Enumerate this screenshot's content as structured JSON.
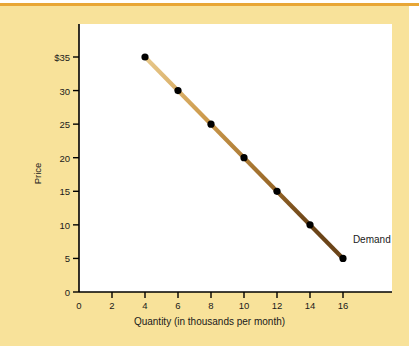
{
  "figure": {
    "background_color": "#F8E29A",
    "plot_background_color": "#FFFFFF",
    "rule_color": "#E8A636",
    "line_color": "#C08A3E",
    "point_color": "#000000"
  },
  "chart_data": {
    "type": "line",
    "title": "",
    "xlabel": "Quantity (in thousands per month)",
    "ylabel": "Price",
    "xlim": [
      0,
      19
    ],
    "ylim": [
      0,
      38
    ],
    "grid": false,
    "legend_position": "inline-right",
    "series": [
      {
        "name": "Demand",
        "x": [
          4,
          6,
          8,
          10,
          12,
          14,
          16
        ],
        "values": [
          35,
          30,
          25,
          20,
          15,
          10,
          5
        ],
        "marker": "filled-circle",
        "color": "#C08A3E"
      }
    ],
    "xticks": [
      0,
      2,
      4,
      6,
      8,
      10,
      12,
      14,
      16
    ],
    "xticklabels": [
      "0",
      "2",
      "4",
      "6",
      "8",
      "10",
      "12",
      "14",
      "16"
    ],
    "yticks": [
      0,
      5,
      10,
      15,
      20,
      25,
      30,
      35
    ],
    "yticklabels": [
      "0",
      "5",
      "10",
      "15",
      "20",
      "25",
      "30",
      "$35"
    ],
    "annotations": [
      {
        "text": "Demand",
        "x": 16.6,
        "y": 7.8
      }
    ]
  }
}
